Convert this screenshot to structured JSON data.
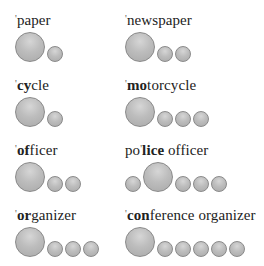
{
  "items": [
    {
      "pre": "",
      "stress_mark": "'",
      "stressed": "",
      "rest": "paper",
      "syllables": [
        "big",
        "small"
      ]
    },
    {
      "pre": "",
      "stress_mark": "'",
      "stressed": "",
      "rest": "newspaper",
      "syllables": [
        "big",
        "small",
        "small"
      ]
    },
    {
      "pre": "",
      "stress_mark": "'",
      "stressed": "cy",
      "rest": "cle",
      "syllables": [
        "big",
        "small"
      ]
    },
    {
      "pre": "",
      "stress_mark": "'",
      "stressed": "mo",
      "rest": "torcycle",
      "syllables": [
        "big",
        "small",
        "small",
        "small"
      ]
    },
    {
      "pre": "",
      "stress_mark": "'",
      "stressed": "of",
      "rest": "ficer",
      "syllables": [
        "big",
        "small",
        "small"
      ]
    },
    {
      "pre": "po",
      "stress_mark": "'",
      "stressed": "lice",
      "rest": " officer",
      "syllables": [
        "small",
        "big",
        "small",
        "small",
        "small"
      ]
    },
    {
      "pre": "",
      "stress_mark": "'",
      "stressed": "or",
      "rest": "ganizer",
      "syllables": [
        "big",
        "small",
        "small",
        "small"
      ]
    },
    {
      "pre": "",
      "stress_mark": "'",
      "stressed": "con",
      "rest": "ference organizer",
      "syllables": [
        "big",
        "small",
        "small",
        "small",
        "small",
        "small"
      ]
    }
  ],
  "colors": {
    "circle_fill": "#bdbdbd",
    "circle_border": "#8a8a8a",
    "text": "#222222"
  }
}
